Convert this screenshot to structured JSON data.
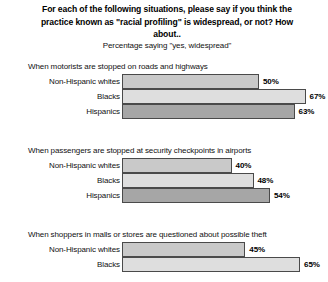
{
  "header": {
    "headline": "For each of the following situations, please say if you think the practice known as \"racial profiling\" is widespread, or not? How about..",
    "subtitle": "Percentage saying \"yes, widespread\""
  },
  "chart_data": {
    "type": "bar",
    "title": "For each of the following situations, please say if you think the practice known as \"racial profiling\" is widespread, or not? How about..",
    "subtitle": "Percentage saying \"yes, widespread\"",
    "xlabel": "",
    "ylabel": "",
    "xlim": [
      0,
      100
    ],
    "orientation": "horizontal",
    "grid": false,
    "legend": "none",
    "value_suffix": "%",
    "categories": [
      "Non-Hispanic whites",
      "Blacks",
      "Hispanics"
    ],
    "series_colors": [
      "#c9c9c9",
      "#dedede",
      "#a6a6a6"
    ],
    "groups": [
      {
        "heading": "When motorists are stopped on roads and highways",
        "bars": [
          {
            "label": "Non-Hispanic whites",
            "value": 50,
            "value_label": "50%",
            "color": "#c9c9c9"
          },
          {
            "label": "Blacks",
            "value": 67,
            "value_label": "67%",
            "color": "#dedede"
          },
          {
            "label": "Hispanics",
            "value": 63,
            "value_label": "63%",
            "color": "#a6a6a6"
          }
        ]
      },
      {
        "heading": "When passengers are stopped at security checkpoints in airports",
        "bars": [
          {
            "label": "Non-Hispanic whites",
            "value": 40,
            "value_label": "40%",
            "color": "#c9c9c9"
          },
          {
            "label": "Blacks",
            "value": 48,
            "value_label": "48%",
            "color": "#dedede"
          },
          {
            "label": "Hispanics",
            "value": 54,
            "value_label": "54%",
            "color": "#a6a6a6"
          }
        ]
      },
      {
        "heading": "When shoppers in malls or stores are questioned about possible theft",
        "bars": [
          {
            "label": "Non-Hispanic whites",
            "value": 45,
            "value_label": "45%",
            "color": "#c9c9c9"
          },
          {
            "label": "Blacks",
            "value": 65,
            "value_label": "65%",
            "color": "#dedede"
          }
        ]
      }
    ]
  }
}
